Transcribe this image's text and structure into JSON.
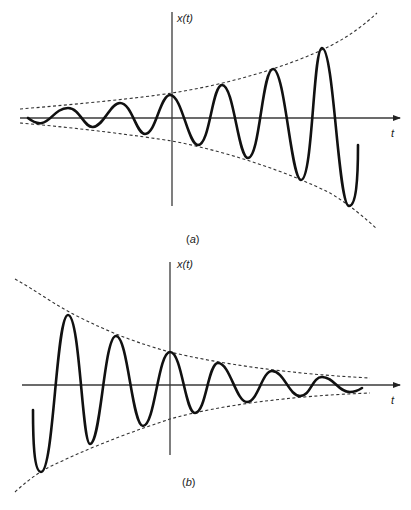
{
  "figure": {
    "panels": [
      {
        "id": "a",
        "label_open": "(",
        "label_letter": "a",
        "label_close": ")",
        "y_axis_label": "x(t)",
        "x_axis_label": "t",
        "description": "Exponentially growing oscillation bounded by a growing dashed exponential envelope"
      },
      {
        "id": "b",
        "label_open": "(",
        "label_letter": "b",
        "label_close": ")",
        "y_axis_label": "x(t)",
        "x_axis_label": "t",
        "description": "Exponentially decaying oscillation bounded by a decaying dashed exponential envelope"
      }
    ],
    "colors": {
      "signal": "#111111",
      "axis": "#3a3a3a",
      "envelope": "#333333",
      "background": "#ffffff"
    }
  }
}
